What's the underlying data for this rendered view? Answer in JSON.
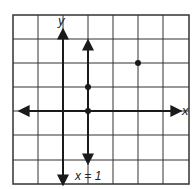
{
  "header": {
    "cropped_title": ""
  },
  "graph": {
    "grid": {
      "cols": 7,
      "rows": 7,
      "x_range": [
        -2,
        5
      ],
      "y_range": [
        -3,
        4
      ]
    },
    "axes": {
      "x_label": "x",
      "y_label": "y"
    },
    "vertical_line": {
      "label": "x = 1",
      "x": 1
    },
    "points": [
      {
        "x": 1,
        "y": 0
      },
      {
        "x": 1,
        "y": 1
      },
      {
        "x": 3,
        "y": 2
      }
    ],
    "colors": {
      "line": "#1a1a1a",
      "grid": "#333333",
      "background": "#ffffff"
    }
  }
}
